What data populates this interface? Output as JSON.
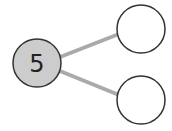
{
  "diagram": {
    "type": "number-bond",
    "whole": {
      "value": "5",
      "fill": "#cccccc",
      "stroke": "#333333"
    },
    "parts": [
      {
        "value": "",
        "fill": "#ffffff",
        "stroke": "#333333"
      },
      {
        "value": "",
        "fill": "#ffffff",
        "stroke": "#333333"
      }
    ],
    "connector_color": "#aaaaaa"
  }
}
